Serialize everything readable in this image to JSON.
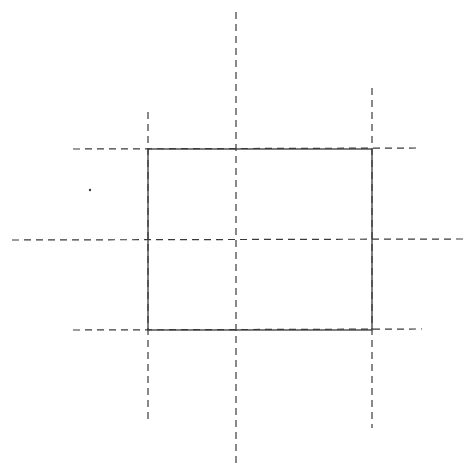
{
  "diagram": {
    "width": 476,
    "height": 475,
    "background": "#ffffff",
    "stroke_color": "#3a3a3a",
    "rectangle": {
      "x": 148,
      "y": 149,
      "width": 224,
      "height": 181,
      "stroke_width": 1.3
    },
    "dashed_lines": [
      {
        "id": "center-vertical",
        "x1": 236,
        "y1": 12,
        "x2": 236,
        "y2": 465
      },
      {
        "id": "center-horizontal",
        "x1": 12,
        "y1": 240,
        "x2": 463,
        "y2": 239
      },
      {
        "id": "left-vertical",
        "x1": 148,
        "y1": 112,
        "x2": 148,
        "y2": 420
      },
      {
        "id": "right-vertical",
        "x1": 372,
        "y1": 88,
        "x2": 372,
        "y2": 428
      },
      {
        "id": "top-horizontal",
        "x1": 73,
        "y1": 149,
        "x2": 420,
        "y2": 148
      },
      {
        "id": "bottom-horizontal",
        "x1": 73,
        "y1": 330,
        "x2": 422,
        "y2": 329
      }
    ],
    "dash_pattern": "7 5",
    "dot": {
      "cx": 90,
      "cy": 190,
      "r": 1.2
    }
  }
}
